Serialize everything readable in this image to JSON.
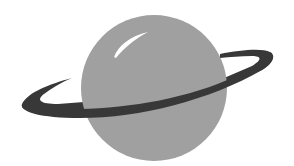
{
  "image": {
    "subject": "planet-with-ring",
    "alt_text": "Planet with ring logo"
  },
  "colors": {
    "background": "#ffffff",
    "planet": "#a0a0a0",
    "ring": "#383838",
    "highlight": "#ffffff"
  }
}
